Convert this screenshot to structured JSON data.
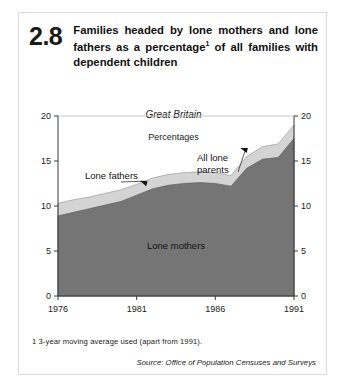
{
  "figure": {
    "number": "2.8",
    "title_prefix": "Families headed by lone mothers and lone fathers as a percentage",
    "title_footnote_marker": "1",
    "title_suffix": " of all families with dependent children",
    "title_full": "Families headed by lone mothers and lone fathers as a percentage1 of all families with dependent children",
    "region": "Great Britain",
    "units": "Percentages",
    "footnote": "1  3-year moving average used (apart from 1991).",
    "source": "Source: Office of Population Censuses and Surveys"
  },
  "colors": {
    "lone_mothers_fill": "#757575",
    "lone_fathers_fill": "#d4d4d4",
    "axis": "#3a3a3a",
    "text": "#222222",
    "frame": "#dcdcdc",
    "background": "#ffffff"
  },
  "chart_data": {
    "type": "area",
    "stacked": true,
    "subtitle": "Great Britain",
    "ylabel": "Percentages",
    "xlabel": "",
    "ylim": [
      0,
      20
    ],
    "xlim": [
      1976,
      1991
    ],
    "yticks": [
      0,
      5,
      10,
      15,
      20
    ],
    "ytick_labels": [
      "0",
      "5",
      "10",
      "15",
      "20"
    ],
    "xticks": [
      1976,
      1981,
      1986,
      1991
    ],
    "xtick_labels": [
      "1976",
      "1981",
      "1986",
      "1991"
    ],
    "dual_y_axis": true,
    "grid": false,
    "legend_position": "inline-annotations",
    "x": [
      1976,
      1977,
      1978,
      1979,
      1980,
      1981,
      1982,
      1983,
      1984,
      1985,
      1986,
      1987,
      1988,
      1989,
      1990,
      1991
    ],
    "series": [
      {
        "name": "Lone mothers",
        "fill": "#757575",
        "values": [
          8.9,
          9.3,
          9.7,
          10.1,
          10.5,
          11.2,
          11.9,
          12.3,
          12.5,
          12.6,
          12.5,
          12.2,
          14.2,
          15.2,
          15.4,
          17.5
        ]
      },
      {
        "name": "Lone fathers",
        "fill": "#d4d4d4",
        "note": "plotted as the band between lone mothers and all lone parents",
        "values": [
          1.4,
          1.4,
          1.3,
          1.3,
          1.3,
          1.2,
          1.2,
          1.2,
          1.2,
          1.2,
          1.2,
          1.2,
          1.3,
          1.4,
          1.5,
          1.5
        ]
      }
    ],
    "total_series": {
      "name": "All lone parents",
      "values": [
        10.3,
        10.7,
        11.0,
        11.4,
        11.8,
        12.4,
        13.1,
        13.5,
        13.7,
        13.8,
        13.7,
        13.4,
        15.5,
        16.6,
        16.9,
        19.0
      ]
    },
    "annotations": [
      {
        "label": "Lone fathers",
        "target_x": 1981.6,
        "target_y": 12.2
      },
      {
        "label": "All lone parents",
        "target_x": 1988.0,
        "target_y": 15.9
      },
      {
        "label": "Lone mothers",
        "target_x": 1983.5,
        "target_y": 5.2,
        "inside": true
      }
    ]
  }
}
